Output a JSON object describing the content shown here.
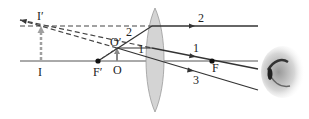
{
  "diagram": {
    "type": "converging-lens-virtual-image-ray-diagram",
    "labels": {
      "image_top": "I′",
      "image_base": "I",
      "object_top": "O′",
      "object_base": "O",
      "focus_left": "F′",
      "focus_right": "F",
      "ray1": "1",
      "ray2": "2",
      "ray2_left": "2",
      "ray3": "3",
      "ray1_left": "1"
    },
    "colors": {
      "line": "#333333",
      "lens_fill": "#d4d4d4",
      "lens_stroke": "#9a9a9a",
      "arrow_gray": "#a0a0a0"
    }
  }
}
